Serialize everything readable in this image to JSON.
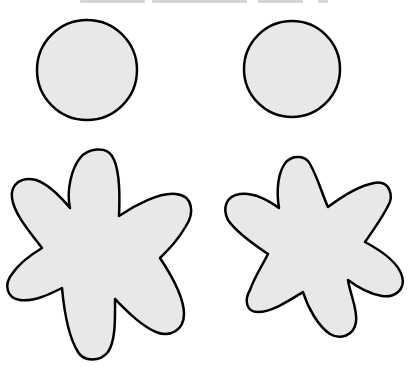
{
  "page": {
    "width": 410,
    "height": 370,
    "background": "#ffffff"
  },
  "header": {
    "cropped_text_fragments": [
      {
        "x": 80,
        "width": 65
      },
      {
        "x": 152,
        "width": 95
      },
      {
        "x": 258,
        "width": 45
      },
      {
        "x": 318,
        "width": 10
      }
    ]
  },
  "style": {
    "fill": "#e8e8e8",
    "stroke": "#000000",
    "stroke_width": 2.5
  },
  "shapes": {
    "circles": [
      {
        "name": "left-circle",
        "cx": 87,
        "cy": 70,
        "r": 50
      },
      {
        "name": "right-circle",
        "cx": 292,
        "cy": 69,
        "r": 48
      }
    ],
    "flowers": [
      {
        "name": "left-flower",
        "petals": 6,
        "path": "M 70 208 C 66 190, 72 168, 80 158 C 88 148, 106 146, 112 156 C 120 168, 120 195, 119 216 C 135 205, 160 192, 176 194 C 194 196, 194 214, 186 226 C 178 240, 170 248, 160 258 C 172 276, 184 298, 184 314 C 184 330, 170 338, 156 332 C 140 325, 126 310, 115 299 C 115 318, 116 340, 108 352 C 100 362, 84 362, 78 352 C 68 336, 64 310, 62 288 C 50 294, 34 302, 20 300 C 6 298, 4 284, 12 274 C 20 262, 32 254, 42 248 C 30 232, 14 214, 12 198 C 10 184, 22 176, 36 180 C 48 184, 60 196, 70 208 Z"
      },
      {
        "name": "right-flower",
        "petals": 6,
        "path": "M 279 208 C 276 190, 278 172, 286 162 C 294 154, 306 156, 310 164 C 318 178, 322 194, 328 207 C 340 198, 358 186, 374 183 C 390 180, 394 196, 388 206 C 382 218, 372 232, 365 242 C 380 250, 398 262, 402 276 C 406 290, 394 298, 382 296 C 370 294, 356 286, 348 280 C 350 294, 358 310, 356 322 C 354 336, 340 340, 330 334 C 318 326, 308 308, 303 292 C 290 300, 272 312, 258 312 C 246 312, 244 300, 250 290 C 254 278, 262 266, 268 254 C 256 246, 236 232, 228 220 C 222 208, 226 196, 240 194 C 254 192, 268 200, 279 208 Z"
      }
    ]
  }
}
